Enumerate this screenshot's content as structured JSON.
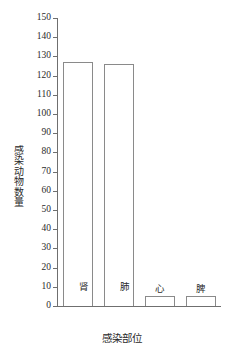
{
  "chart_data": {
    "type": "bar",
    "title": "",
    "xlabel": "感染部位",
    "ylabel": "感染动物数量",
    "categories": [
      "肾",
      "肺",
      "心",
      "脾"
    ],
    "values": [
      127,
      126,
      5,
      5
    ],
    "ylim": [
      0,
      150
    ],
    "ytick_step": 10,
    "ytick_labels": [
      "0",
      "10",
      "20",
      "30",
      "40",
      "50",
      "60",
      "70",
      "80",
      "90",
      "100",
      "110",
      "120",
      "130",
      "140",
      "150"
    ],
    "grid": false,
    "legend": null,
    "bar_fill_color": "#ffffff",
    "bar_outline_color": "#8a8a8a",
    "axis_color": "#6f6f6f",
    "text_color": "#2b2b2b",
    "category_label_placement": "inside-bottom"
  }
}
